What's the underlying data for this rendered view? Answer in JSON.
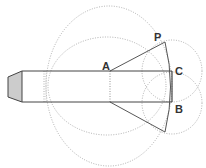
{
  "diagram": {
    "type": "geometric construction",
    "labels": {
      "A": "A",
      "P": "P",
      "C": "C",
      "B": "B"
    },
    "colors": {
      "stroke": "#444444",
      "dotted": "#9a9a9a",
      "cap_fill": "#cccccc",
      "label": "#333333"
    },
    "shapes": {
      "rectangle": {
        "x1": 22,
        "y1": 71,
        "x2": 172,
        "y2": 102
      },
      "cap": [
        [
          8,
          77
        ],
        [
          22,
          71
        ],
        [
          22,
          102
        ],
        [
          8,
          97
        ]
      ],
      "large_circle": {
        "cx": 109,
        "cy": 86,
        "rx": 63,
        "ry": 80
      },
      "medium_circle": {
        "cx": 107,
        "cy": 86,
        "rx": 59,
        "ry": 49
      },
      "small_circle_C": {
        "cx": 172,
        "cy": 71,
        "rx": 30,
        "ry": 31
      },
      "small_circle_B": {
        "cx": 172,
        "cy": 103,
        "rx": 30,
        "ry": 31
      },
      "points": {
        "A": [
          110,
          71
        ],
        "P": [
          165,
          42
        ],
        "C": [
          172,
          71
        ],
        "B": [
          172,
          102
        ],
        "P_lower": [
          165,
          132
        ]
      }
    }
  }
}
